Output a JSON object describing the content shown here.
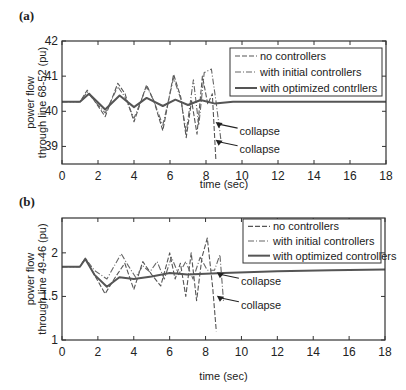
{
  "chart_data": [
    {
      "type": "line",
      "panel": "(a)",
      "title": "",
      "xlabel": "time (sec)",
      "ylabel": "power flow through line 68-52 (pu)",
      "ylabel_lines": [
        "power flow",
        "through line 68-52 (pu)"
      ],
      "xlim": [
        0,
        18
      ],
      "ylim": [
        38.5,
        42
      ],
      "xticks": [
        0,
        2,
        4,
        6,
        8,
        10,
        12,
        14,
        16,
        18
      ],
      "yticks": [
        39,
        40,
        41,
        42
      ],
      "grid": false,
      "legend_position": "upper right",
      "legend": [
        "no controllers",
        "with initial controllers",
        "with optimized contrllers"
      ],
      "annotations": [
        {
          "text": "collapse",
          "x": 9.2,
          "y": 39.55
        },
        {
          "text": "collapse",
          "x": 9.2,
          "y": 39.05
        }
      ],
      "series": [
        {
          "name": "no controllers",
          "style": "dashed",
          "x": [
            0,
            1,
            1.4,
            1.8,
            2.4,
            3.1,
            3.5,
            4.0,
            4.7,
            5.1,
            5.6,
            6.2,
            6.6,
            6.9,
            7.2,
            7.5,
            7.8,
            8.1,
            8.35,
            8.55
          ],
          "y": [
            40.27,
            40.27,
            40.6,
            40.3,
            39.85,
            40.8,
            40.5,
            39.7,
            40.75,
            40.3,
            39.45,
            41.05,
            40.4,
            39.25,
            40.3,
            39.35,
            41.0,
            40.2,
            40.5,
            38.6
          ]
        },
        {
          "name": "with initial controllers",
          "style": "dashdot",
          "x": [
            0,
            1,
            1.4,
            1.8,
            2.4,
            3.1,
            3.5,
            4.0,
            4.7,
            5.1,
            5.6,
            6.2,
            6.6,
            6.9,
            7.3,
            7.6,
            7.9,
            8.3,
            8.55,
            8.85
          ],
          "y": [
            40.27,
            40.27,
            40.55,
            40.3,
            39.95,
            40.7,
            40.4,
            39.8,
            40.7,
            40.3,
            39.6,
            40.95,
            40.35,
            39.4,
            40.9,
            39.6,
            41.1,
            41.2,
            40.3,
            39.1
          ]
        },
        {
          "name": "with optimized contrllers",
          "style": "solid",
          "x": [
            0,
            1,
            1.5,
            2.4,
            3.2,
            4.0,
            4.7,
            5.6,
            6.3,
            7.0,
            7.7,
            8.5,
            9.5,
            12,
            18
          ],
          "y": [
            40.27,
            40.27,
            40.5,
            40.05,
            40.45,
            40.12,
            40.38,
            40.15,
            40.33,
            40.18,
            40.32,
            40.22,
            40.27,
            40.27,
            40.27
          ]
        }
      ]
    },
    {
      "type": "line",
      "panel": "(b)",
      "title": "",
      "xlabel": "time (sec)",
      "ylabel": "power flow through line 49-46 (pu)",
      "ylabel_lines": [
        "power flow",
        "through line 49-46 (pu)"
      ],
      "xlim": [
        0,
        18
      ],
      "ylim": [
        1,
        2.4
      ],
      "xticks": [
        0,
        2,
        4,
        6,
        8,
        10,
        12,
        14,
        16,
        18
      ],
      "yticks": [
        1,
        1.5,
        2
      ],
      "grid": false,
      "legend_position": "upper right",
      "legend": [
        "no controllers",
        "with initial controllers",
        "with optimized controllers"
      ],
      "annotations": [
        {
          "text": "collapse",
          "x": 9.3,
          "y": 1.72
        },
        {
          "text": "collapse",
          "x": 9.3,
          "y": 1.45
        }
      ],
      "series": [
        {
          "name": "no controllers",
          "style": "dashed",
          "x": [
            0,
            1,
            1.3,
            1.8,
            2.4,
            3.0,
            3.5,
            4.0,
            4.5,
            5.0,
            5.5,
            6.0,
            6.3,
            6.6,
            6.9,
            7.2,
            7.5,
            7.8,
            8.1,
            8.4,
            8.6
          ],
          "y": [
            1.84,
            1.84,
            1.94,
            1.75,
            1.53,
            1.73,
            1.88,
            1.58,
            1.9,
            1.75,
            1.62,
            2.0,
            1.7,
            1.88,
            1.5,
            2.0,
            1.45,
            1.95,
            2.17,
            1.6,
            1.1
          ]
        },
        {
          "name": "with initial controllers",
          "style": "dashdot",
          "x": [
            0,
            1,
            1.3,
            1.8,
            2.5,
            3.3,
            3.7,
            4.1,
            4.5,
            4.9,
            5.3,
            5.7,
            6.1,
            6.5,
            6.9,
            7.3,
            7.7,
            8.1,
            8.5,
            8.8,
            9.0
          ],
          "y": [
            1.84,
            1.84,
            1.94,
            1.8,
            1.7,
            1.99,
            1.85,
            1.72,
            1.85,
            1.78,
            1.9,
            1.7,
            1.95,
            1.75,
            1.9,
            1.7,
            1.95,
            1.8,
            1.8,
            1.98,
            1.45
          ]
        },
        {
          "name": "with optimized controllers",
          "style": "solid",
          "x": [
            0,
            1,
            1.3,
            1.8,
            2.5,
            3.2,
            4.0,
            5.0,
            6.0,
            7.0,
            8.0,
            9.0,
            12,
            15,
            18
          ],
          "y": [
            1.84,
            1.84,
            1.93,
            1.75,
            1.61,
            1.72,
            1.7,
            1.73,
            1.77,
            1.75,
            1.76,
            1.77,
            1.79,
            1.8,
            1.81
          ]
        }
      ]
    }
  ]
}
